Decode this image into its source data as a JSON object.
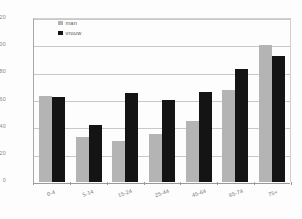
{
  "chart_data": {
    "type": "bar",
    "title": "",
    "subtitle": "",
    "xlabel": "",
    "ylabel": "",
    "ylim": [
      0,
      120
    ],
    "ytick_values": [
      120,
      100,
      80,
      60,
      40,
      20,
      0
    ],
    "ytick_labels": [
      "120",
      "100",
      "80",
      "60",
      "40",
      "20",
      "0"
    ],
    "grid": true,
    "legend_position": "top-left",
    "categories": [
      "0-4",
      "5-14",
      "15-24",
      "25-44",
      "45-64",
      "65-74",
      "75+"
    ],
    "series": [
      {
        "name": "man",
        "color": "#b4b4b4",
        "values": [
          63,
          33,
          30,
          35,
          45,
          67,
          100
        ]
      },
      {
        "name": "vrouw",
        "color": "#141414",
        "values": [
          62,
          42,
          65,
          60,
          66,
          83,
          92
        ]
      }
    ]
  }
}
